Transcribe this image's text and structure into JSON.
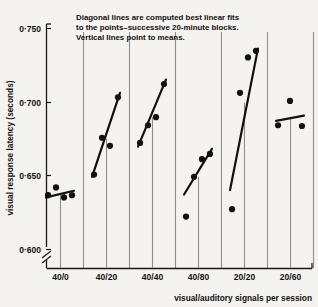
{
  "chart_data": {
    "type": "scatter",
    "title": "",
    "annotation": [
      "Diagonal lines are computed best linear fits",
      "to the points–successive 20-minute blocks.",
      "Vertical lines point to means."
    ],
    "xlabel": "visual/auditory signals per session",
    "ylabel": "visual response latency (seconds)",
    "categories": [
      "40/0",
      "40/20",
      "40/40",
      "40/80",
      "20/20",
      "20/60"
    ],
    "yticks": [
      "0·750",
      "0·700",
      "0·650",
      "0·600"
    ],
    "ytick_values": [
      0.75,
      0.7,
      0.65,
      0.6
    ],
    "ylim": [
      0.6,
      0.75
    ],
    "axis_break": true,
    "grid": false,
    "legend": "none",
    "groups": [
      {
        "name": "40/0",
        "points": [
          {
            "block": 1,
            "value": 0.6365
          },
          {
            "block": 2,
            "value": 0.6418
          },
          {
            "block": 3,
            "value": 0.635
          },
          {
            "block": 4,
            "value": 0.6365
          }
        ],
        "fit": {
          "y_start": 0.635,
          "y_end": 0.6395
        },
        "mean": 0.6375
      },
      {
        "name": "40/20",
        "points": [
          {
            "block": 1,
            "value": 0.6505
          },
          {
            "block": 2,
            "value": 0.6755
          },
          {
            "block": 3,
            "value": 0.67
          },
          {
            "block": 4,
            "value": 0.703
          }
        ],
        "fit": {
          "y_start": 0.649,
          "y_end": 0.706
        },
        "mean": 0.6748
      },
      {
        "name": "40/40",
        "points": [
          {
            "block": 1,
            "value": 0.672
          },
          {
            "block": 2,
            "value": 0.684
          },
          {
            "block": 3,
            "value": 0.6895
          },
          {
            "block": 4,
            "value": 0.712
          }
        ],
        "fit": {
          "y_start": 0.6695,
          "y_end": 0.715
        },
        "mean": 0.6894
      },
      {
        "name": "40/80",
        "points": [
          {
            "block": 1,
            "value": 0.622
          },
          {
            "block": 2,
            "value": 0.649
          },
          {
            "block": 3,
            "value": 0.661
          },
          {
            "block": 4,
            "value": 0.6645
          }
        ],
        "fit": {
          "y_start": 0.637,
          "y_end": 0.668
        },
        "mean": 0.6491
      },
      {
        "name": "20/20",
        "points": [
          {
            "block": 1,
            "value": 0.627
          },
          {
            "block": 2,
            "value": 0.706
          },
          {
            "block": 3,
            "value": 0.73
          },
          {
            "block": 4,
            "value": 0.7345
          }
        ],
        "fit": {
          "y_start": 0.64,
          "y_end": 0.736
        },
        "mean": 0.6994
      },
      {
        "name": "20/60",
        "points": [
          {
            "block": 1,
            "value": 0.684
          },
          {
            "block": 2,
            "value": 0.7005
          },
          {
            "block": 3,
            "value": 0.6835
          }
        ],
        "fit": {
          "y_start": 0.687,
          "y_end": 0.6905
        },
        "mean": 0.6893
      }
    ]
  }
}
